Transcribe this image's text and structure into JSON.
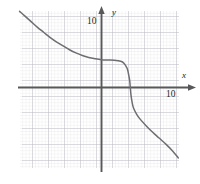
{
  "figure": {
    "background_color": "#ffffff"
  },
  "axes": {
    "x_axis_label": "x",
    "y_axis_label": "y",
    "x_tick_label": "10",
    "y_tick_label": "10",
    "axis_color": "#58585b",
    "arrow_x_name": "x-axis-arrow",
    "arrow_y_name": "y-axis-arrow"
  },
  "grid": {
    "minor_color": "#d9d9dd",
    "major_color": "#b0b0b8",
    "minor_spacing_px": 3.2,
    "major_every": 5,
    "left_px": 20,
    "right_px": 179,
    "top_px": 11,
    "bottom_px": 168
  },
  "chart_data": {
    "type": "line",
    "title": "",
    "xlabel": "x",
    "ylabel": "y",
    "xlim": [
      -12.8,
      12.0
    ],
    "ylim": [
      -12.6,
      11.9
    ],
    "xticks": [
      10
    ],
    "yticks": [
      10
    ],
    "grid": true,
    "legend": null,
    "curve_color": "#6d6e71",
    "series": [
      {
        "name": "curve",
        "x": [
          -12.8,
          -12.0,
          -11.0,
          -10.0,
          -9.0,
          -8.0,
          -7.0,
          -6.0,
          -5.0,
          -4.0,
          -3.0,
          -2.0,
          -1.0,
          0.0,
          1.0,
          2.0,
          3.0,
          3.5,
          4.0,
          4.2,
          4.4,
          4.5,
          4.6,
          4.8,
          5.0,
          5.5,
          6.0,
          7.0,
          8.0,
          9.0,
          10.0,
          11.0,
          12.0
        ],
        "y": [
          11.9,
          11.2,
          10.3,
          9.4,
          8.6,
          7.8,
          7.1,
          6.5,
          5.9,
          5.4,
          5.0,
          4.7,
          4.5,
          4.35,
          4.3,
          4.25,
          4.1,
          3.8,
          3.0,
          2.2,
          1.1,
          0.0,
          -1.1,
          -2.4,
          -3.2,
          -4.2,
          -4.9,
          -6.0,
          -7.0,
          -7.9,
          -8.8,
          -9.8,
          -11.0
        ]
      }
    ]
  }
}
